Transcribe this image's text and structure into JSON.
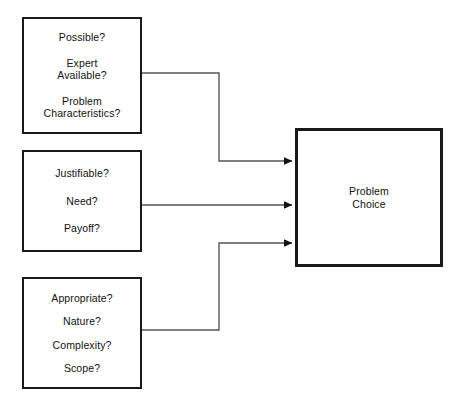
{
  "diagram": {
    "background_color": "#ffffff",
    "line_color": "#555555",
    "border_color": "#1a1a1a",
    "nodes": {
      "possible": {
        "lines": [
          "Possible?",
          "Expert\nAvailable?",
          "Problem\nCharacteristics?"
        ]
      },
      "justifiable": {
        "lines": [
          "Justifiable?",
          "Need?",
          "Payoff?"
        ]
      },
      "appropriate": {
        "lines": [
          "Appropriate?",
          "Nature?",
          "Complexity?",
          "Scope?"
        ]
      },
      "outcome": {
        "lines": [
          "Problem\nChoice"
        ]
      }
    }
  }
}
